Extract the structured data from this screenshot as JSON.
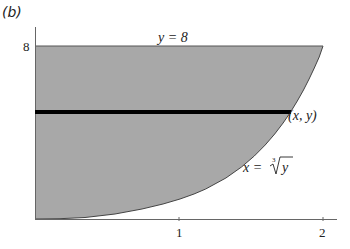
{
  "panel_label": "(b)",
  "diagram": {
    "type": "region-between-curves",
    "region_fill": "#a8a8a8",
    "curve_color": "#555555",
    "strip_color": "#000000",
    "x_ticks": [
      {
        "value": 1,
        "label": "1"
      },
      {
        "value": 2,
        "label": "2"
      }
    ],
    "y_ticks": [
      {
        "value": 8,
        "label": "8"
      }
    ],
    "top_line_label": "y = 8",
    "curve_label_lhs": "x =",
    "curve_label_root_index": "3",
    "curve_label_radicand": "y",
    "point_label": "(x, y)",
    "strip_y": 5
  }
}
